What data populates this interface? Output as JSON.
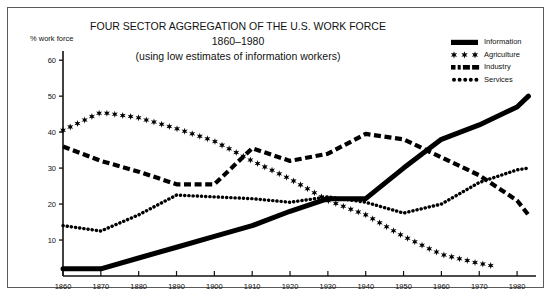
{
  "figure": {
    "title_line1": "FOUR SECTOR AGGREGATION OF THE U.S. WORK FORCE",
    "title_line2": "1860–1980",
    "title_line3": "(using low estimates of information workers)",
    "y_axis_label": "% work force"
  },
  "legend": {
    "position": "top-right",
    "items": [
      {
        "label": "Information",
        "marker": "solid-thick-line",
        "color": "#000000"
      },
      {
        "label": "Agriculture",
        "marker": "star-markers",
        "color": "#000000"
      },
      {
        "label": "Industry",
        "marker": "dashed-line",
        "color": "#000000"
      },
      {
        "label": "Services",
        "marker": "dotted-line",
        "color": "#000000"
      }
    ]
  },
  "chart_data": {
    "type": "line",
    "title": "FOUR SECTOR AGGREGATION OF THE U.S. WORK FORCE 1860–1980 (using low estimates of information workers)",
    "xlabel": "",
    "ylabel": "% work force",
    "xlim": [
      1860,
      1985
    ],
    "ylim": [
      0,
      62
    ],
    "yticks": [
      10,
      20,
      30,
      40,
      50,
      60
    ],
    "xticks": [
      1860,
      1870,
      1880,
      1890,
      1900,
      1910,
      1920,
      1930,
      1940,
      1950,
      1960,
      1970,
      1980
    ],
    "grid": false,
    "legend_position": "top-right",
    "x": [
      1860,
      1870,
      1880,
      1890,
      1900,
      1910,
      1920,
      1930,
      1940,
      1950,
      1960,
      1970,
      1980
    ],
    "series": [
      {
        "name": "Information",
        "style": "solid-thick",
        "x": [
          1860,
          1870,
          1880,
          1890,
          1900,
          1910,
          1920,
          1930,
          1940,
          1950,
          1960,
          1970,
          1980,
          1983
        ],
        "values": [
          2,
          2,
          5,
          8,
          11,
          14,
          18,
          21.5,
          21.5,
          30,
          38,
          42,
          47,
          50
        ]
      },
      {
        "name": "Agriculture",
        "style": "star-markers",
        "x": [
          1860,
          1870,
          1880,
          1890,
          1900,
          1910,
          1920,
          1930,
          1940,
          1950,
          1960,
          1970,
          1975
        ],
        "values": [
          40.5,
          45.5,
          44,
          41,
          37.5,
          32,
          27,
          21,
          17,
          11,
          6,
          3.5,
          2.5
        ]
      },
      {
        "name": "Industry",
        "style": "dashed",
        "x": [
          1860,
          1870,
          1880,
          1890,
          1900,
          1910,
          1920,
          1930,
          1940,
          1950,
          1960,
          1970,
          1980,
          1983
        ],
        "values": [
          36,
          32,
          29,
          25.5,
          25.5,
          35.5,
          32,
          34,
          39.5,
          38,
          33,
          28,
          21,
          17
        ]
      },
      {
        "name": "Services",
        "style": "dotted",
        "x": [
          1860,
          1870,
          1880,
          1890,
          1900,
          1910,
          1920,
          1930,
          1940,
          1950,
          1960,
          1970,
          1980,
          1983
        ],
        "values": [
          14,
          12.5,
          17,
          22.5,
          22,
          21.5,
          20.5,
          22,
          20.5,
          17.5,
          20,
          26,
          29.5,
          30
        ]
      }
    ]
  }
}
